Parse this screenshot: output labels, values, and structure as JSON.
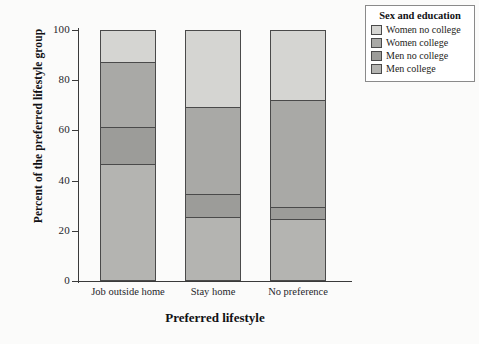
{
  "chart_data": {
    "type": "bar",
    "title": "",
    "subtitle": "",
    "xlabel": "Preferred lifestyle",
    "ylabel": "Percent of the preferred lifestyle group",
    "categories": [
      "Job outside home",
      "Stay home",
      "No preference"
    ],
    "ylim": [
      0,
      100
    ],
    "yticks": [
      0,
      20,
      40,
      60,
      80,
      100
    ],
    "ytick_labels": [
      "0",
      "20",
      "40",
      "60",
      "80",
      "100"
    ],
    "grid": false,
    "stacked": true,
    "legend_position": "right",
    "legend_title": "Sex and education",
    "series": [
      {
        "name": "Women no college",
        "color": "#d5d5d2",
        "values": [
          13,
          31,
          28
        ],
        "cumulative_top": [
          100,
          100,
          100
        ]
      },
      {
        "name": "Women college",
        "color": "#a9a9a6",
        "values": [
          26,
          35,
          43
        ],
        "cumulative_top": [
          87,
          69,
          72
        ]
      },
      {
        "name": "Men no college",
        "color": "#9c9c99",
        "values": [
          15,
          9,
          5
        ],
        "cumulative_top": [
          61,
          34,
          29
        ]
      },
      {
        "name": "Men college",
        "color": "#b4b4b1",
        "values": [
          46,
          25,
          24
        ],
        "cumulative_top": [
          46,
          25,
          24
        ]
      }
    ]
  },
  "axes": {
    "y_title": "Percent of the preferred lifestyle group",
    "x_title": "Preferred lifestyle",
    "y_ticks": [
      "100",
      "80",
      "60",
      "40",
      "20",
      "0"
    ],
    "x_ticks": [
      "Job outside home",
      "Stay home",
      "No preference"
    ]
  },
  "legend": {
    "title": "Sex and education",
    "items": [
      {
        "label": "Women no college",
        "color": "#d5d5d2"
      },
      {
        "label": "Women college",
        "color": "#a9a9a6"
      },
      {
        "label": "Men no college",
        "color": "#9c9c99"
      },
      {
        "label": "Men college",
        "color": "#b4b4b1"
      }
    ]
  },
  "colors": {
    "background": "#fbfbfa",
    "axis": "#3a3a3a",
    "bar_outline": "#4a4a4a",
    "text": "#111114"
  }
}
